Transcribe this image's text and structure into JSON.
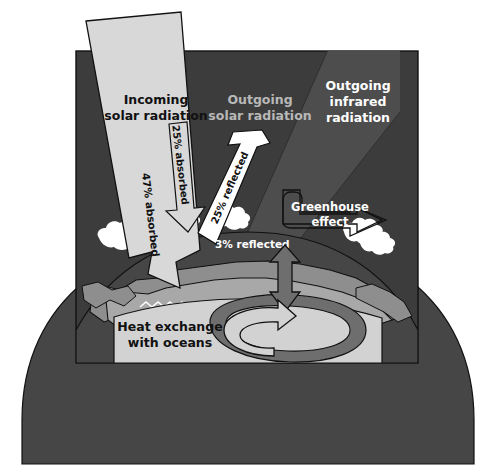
{
  "diagram": {
    "labels": {
      "incoming_solar": "Incoming\nsolar radiation",
      "incoming_solar_line1": "Incoming",
      "incoming_solar_line2": "solar radiation",
      "outgoing_solar_line1": "Outgoing",
      "outgoing_solar_line2": "solar radiation",
      "outgoing_infrared_line1": "Outgoing",
      "outgoing_infrared_line2": "infrared",
      "outgoing_infrared_line3": "radiation",
      "absorbed_47": "47% absorbed",
      "absorbed_25": "25% absorbed",
      "reflected_25": "25% reflected",
      "reflected_3": "3% reflected",
      "greenhouse_line1": "Greenhouse",
      "greenhouse_line2": "effect",
      "heat_exchange_line1": "Heat exchange",
      "heat_exchange_line2": "with oceans"
    },
    "values": {
      "absorbed_surface_pct": 47,
      "absorbed_atmosphere_pct": 25,
      "reflected_atmosphere_pct": 25,
      "reflected_surface_pct": 3
    },
    "colors": {
      "background": "#ffffff",
      "sky": "#3c3c3c",
      "sky_edge": "#2a2a2a",
      "earth_body": "#464646",
      "land_light": "#a8a8a8",
      "land_mid": "#8e8e8e",
      "ocean_block": "#d2d2d2",
      "ocean_dark": "#6e6e6e",
      "beam_light": "#d8d8d8",
      "beam_ir": "#4a4a4a",
      "cloud": "#ffffff",
      "arrow_fill": "#cfcfcf",
      "arrow_dark": "#6e6e6e",
      "text_dark": "#111111",
      "text_light": "#ffffff",
      "text_muted": "#b8b8b8",
      "outline": "#111111"
    }
  }
}
